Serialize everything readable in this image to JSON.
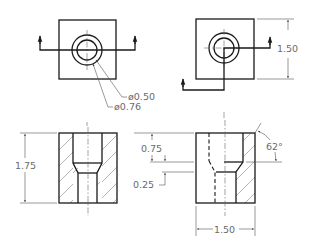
{
  "drawing": {
    "type": "orthographic-section-drawing",
    "colors": {
      "object_line": "#1a1a1a",
      "dimension_text": "#6a6a6a",
      "background": "#ffffff"
    },
    "views": {
      "top_left": {
        "name": "top view A",
        "leaders": [
          {
            "label": "ø0.50"
          },
          {
            "label": "ø0.76"
          }
        ]
      },
      "top_right": {
        "name": "top view B",
        "dimension": {
          "label": "1.50"
        }
      },
      "bottom_left": {
        "name": "full section",
        "dimension": {
          "label": "1.75"
        }
      },
      "bottom_right": {
        "name": "half section",
        "dimensions": [
          {
            "id": "counterbore_depth",
            "label": "0.75"
          },
          {
            "id": "taper_depth",
            "label": "0.25"
          },
          {
            "id": "width",
            "label": "1.50"
          },
          {
            "id": "angle",
            "label": "62°"
          }
        ]
      }
    }
  }
}
